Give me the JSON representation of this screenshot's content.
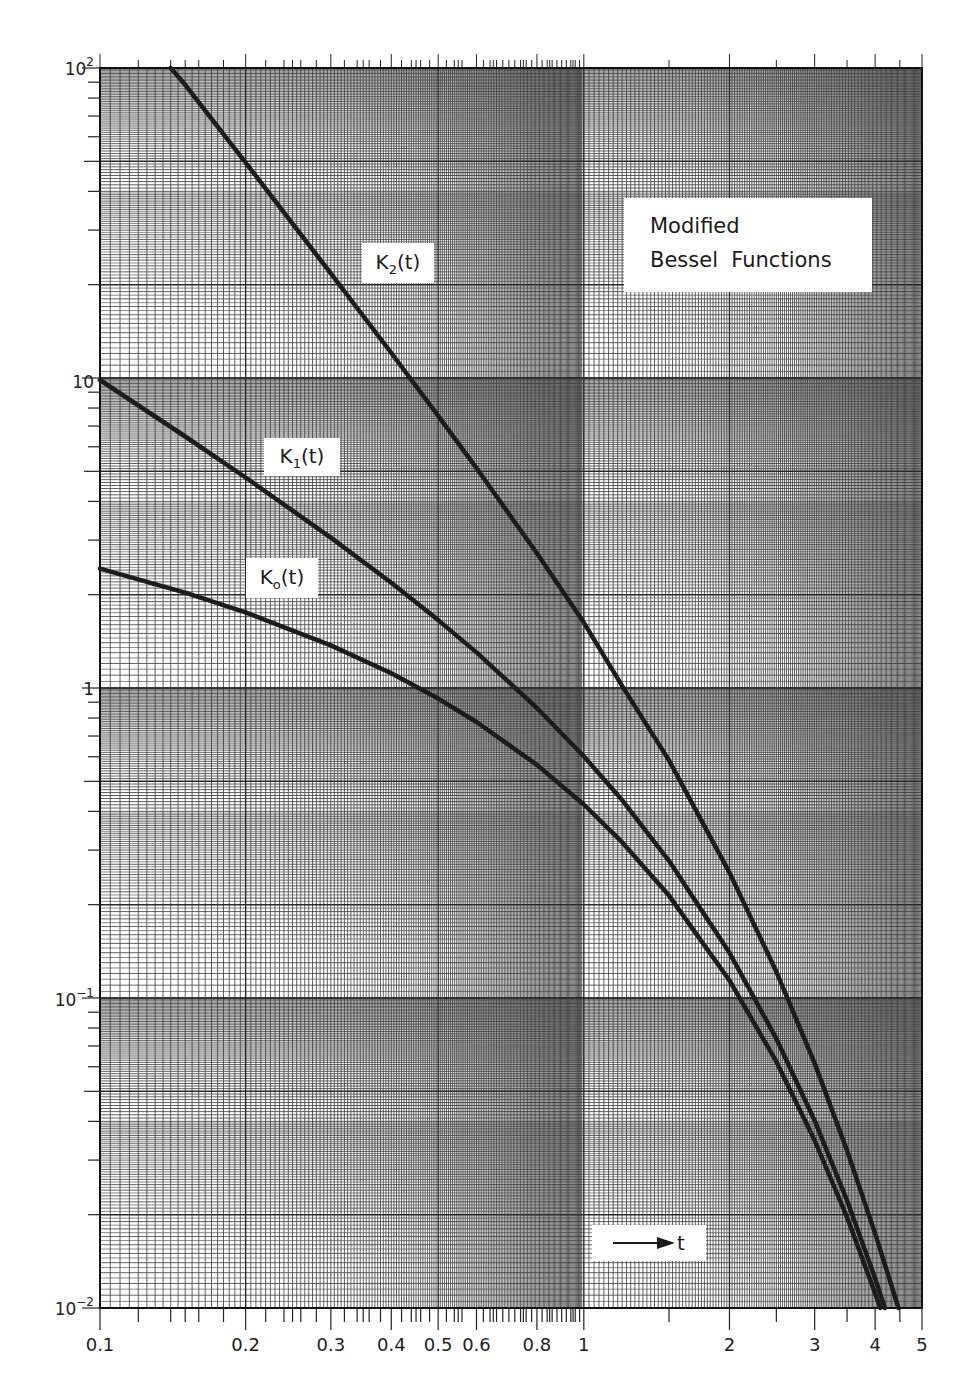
{
  "chart_data": {
    "type": "line",
    "title": "Modified Bessel Functions",
    "title_lines": [
      "Modified",
      "Bessel  Functions"
    ],
    "xlabel": "t",
    "ylabel": "",
    "xscale": "log",
    "yscale": "log",
    "xlim": [
      0.1,
      5
    ],
    "ylim": [
      0.01,
      100
    ],
    "grid": true,
    "x_tick_labels": [
      "0.1",
      "0.2",
      "0.3",
      "0.4",
      "0.5",
      "0.6",
      "0.8",
      "1",
      "2",
      "3",
      "4",
      "5"
    ],
    "x_tick_values": [
      0.1,
      0.2,
      0.3,
      0.4,
      0.5,
      0.6,
      0.8,
      1,
      2,
      3,
      4,
      5
    ],
    "y_tick_labels": [
      {
        "base": "10",
        "exp": "2",
        "value": 100
      },
      {
        "base": "10",
        "exp": "",
        "value": 10
      },
      {
        "base": "1",
        "exp": "",
        "value": 1
      },
      {
        "base": "10",
        "exp": "−1",
        "value": 0.1
      },
      {
        "base": "10",
        "exp": "−2",
        "value": 0.01
      }
    ],
    "axis_arrow_label": "t",
    "series": [
      {
        "name": "K2(t)",
        "label_main": "K",
        "label_sub": "2",
        "label_suffix": "(t)",
        "x": [
          0.14,
          0.15,
          0.2,
          0.3,
          0.4,
          0.5,
          0.6,
          0.8,
          1.0,
          1.2,
          1.5,
          2.0,
          2.5,
          3.0,
          3.5,
          4.0,
          4.47
        ],
        "values": [
          101.6,
          88.3,
          49.51,
          21.75,
          12.04,
          7.55,
          5.12,
          2.72,
          1.625,
          1.016,
          0.584,
          0.2538,
          0.1215,
          0.0615,
          0.0322,
          0.0174,
          0.01
        ]
      },
      {
        "name": "K1(t)",
        "label_main": "K",
        "label_sub": "1",
        "label_suffix": "(t)",
        "x": [
          0.1,
          0.15,
          0.2,
          0.3,
          0.4,
          0.5,
          0.6,
          0.8,
          1.0,
          1.2,
          1.5,
          2.0,
          2.5,
          3.0,
          3.5,
          4.0,
          4.19
        ],
        "values": [
          9.854,
          6.477,
          4.776,
          3.056,
          2.185,
          1.656,
          1.303,
          0.862,
          0.602,
          0.435,
          0.277,
          0.1399,
          0.0739,
          0.0402,
          0.0222,
          0.01248,
          0.01
        ]
      },
      {
        "name": "K0(t)",
        "label_main": "K",
        "label_sub": "o",
        "label_suffix": "(t)",
        "x": [
          0.1,
          0.15,
          0.2,
          0.3,
          0.4,
          0.5,
          0.6,
          0.8,
          1.0,
          1.2,
          1.5,
          2.0,
          2.5,
          3.0,
          3.5,
          4.0,
          4.1
        ],
        "values": [
          2.427,
          2.03,
          1.753,
          1.372,
          1.115,
          0.924,
          0.777,
          0.565,
          0.421,
          0.318,
          0.214,
          0.1139,
          0.0623,
          0.0347,
          0.0196,
          0.01116,
          0.01
        ]
      }
    ],
    "colors": {
      "curve": "#1c1c1c",
      "grid_major": "#2a2a2a",
      "grid_minor": "#3a3a3a",
      "background": "#ffffff"
    }
  }
}
